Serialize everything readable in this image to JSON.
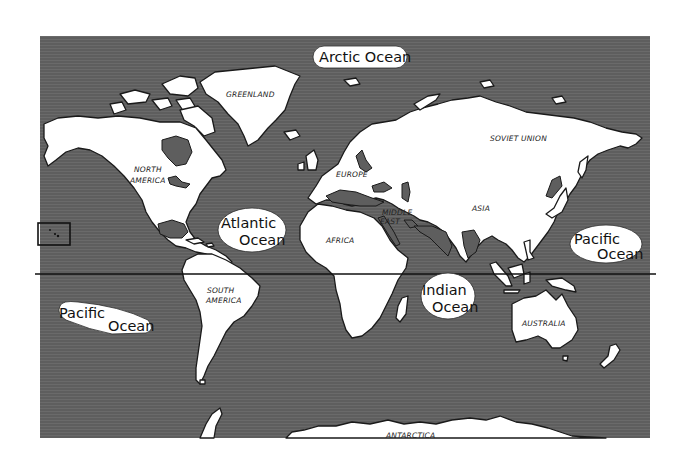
{
  "map": {
    "title": "World Map",
    "colors": {
      "ocean": "#5e5e5e",
      "land": "#ffffff",
      "outline": "#1a1a1a"
    },
    "continents": [
      {
        "id": "north-america",
        "label_lines": [
          "NORTH",
          "AMERICA"
        ]
      },
      {
        "id": "south-america",
        "label_lines": [
          "SOUTH",
          "AMERICA"
        ]
      },
      {
        "id": "greenland",
        "label_lines": [
          "GREENLAND"
        ]
      },
      {
        "id": "europe",
        "label_lines": [
          "EUROPE"
        ]
      },
      {
        "id": "africa",
        "label_lines": [
          "AFRICA"
        ]
      },
      {
        "id": "middle-east",
        "label_lines": [
          "MIDDLE",
          "EAST"
        ]
      },
      {
        "id": "soviet-union",
        "label_lines": [
          "SOVIET UNION"
        ]
      },
      {
        "id": "asia",
        "label_lines": [
          "ASIA"
        ]
      },
      {
        "id": "australia",
        "label_lines": [
          "AUSTRALIA"
        ]
      },
      {
        "id": "antarctica",
        "label_lines": [
          "ANTARCTICA"
        ]
      }
    ],
    "oceans": [
      {
        "id": "arctic-ocean",
        "label_lines": [
          "Arctic Ocean"
        ]
      },
      {
        "id": "atlantic-ocean",
        "label_lines": [
          "Atlantic",
          "Ocean"
        ]
      },
      {
        "id": "indian-ocean",
        "label_lines": [
          "Indian",
          "Ocean"
        ]
      },
      {
        "id": "pacific-ocean-west",
        "label_lines": [
          "Pacific",
          "Ocean"
        ]
      },
      {
        "id": "pacific-ocean-east",
        "label_lines": [
          "Pacific",
          "Ocean"
        ]
      }
    ],
    "features": {
      "equator_line": "equator",
      "inset_box": "hawaii-inset"
    }
  }
}
